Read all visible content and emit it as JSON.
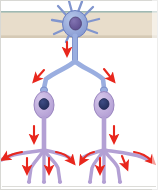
{
  "figure": {
    "background_color": "#ffffff",
    "frame_border_color": "#d8d8d4",
    "width": 158,
    "height": 190
  },
  "tissue_band": {
    "name": "spinal cord / CNS tissue band",
    "fill_color": "#e8ddcb",
    "top_edge_color": "#9fb9b4",
    "shadow_color": "#c6bba9",
    "top": 11,
    "height": 27
  },
  "neurons": [
    {
      "id": "preganglionic-neuron",
      "label": "preganglionic neuron",
      "soma_shape": "stellate",
      "soma_fill": "#93a9dc",
      "soma_stroke": "#6b7fc0",
      "nucleus_fill": "#6a5a9c",
      "nucleus_stroke": "#514277",
      "dendrite_count": 9,
      "cx": 75,
      "cy": 24,
      "soma_rx": 12,
      "soma_ry": 13
    },
    {
      "id": "postganglionic-neuron-left",
      "label": "postganglionic ganglion neuron (left)",
      "soma_shape": "spindle",
      "soma_fill": "#c3b0de",
      "soma_stroke": "#9a86c0",
      "nucleus_fill": "#2d3a6e",
      "nucleus_stroke": "#222c55",
      "cx": 44,
      "cy": 105,
      "soma_rx": 10,
      "soma_ry": 13
    },
    {
      "id": "postganglionic-neuron-right",
      "label": "postganglionic ganglion neuron (right)",
      "soma_shape": "spindle",
      "soma_fill": "#c3b0de",
      "soma_stroke": "#9a86c0",
      "nucleus_fill": "#2d3a6e",
      "nucleus_stroke": "#222c55",
      "cx": 104,
      "cy": 105,
      "soma_rx": 10,
      "soma_ry": 13
    }
  ],
  "axons": {
    "preganglionic_color": "#9aaee0",
    "preganglionic_stroke": "#7287c4",
    "postganglionic_color": "#b3a0d4",
    "postganglionic_stroke": "#8d79b6",
    "main_axon_width": 5,
    "branch_width": 4,
    "terminal_width": 3.5
  },
  "arrows": {
    "color": "#e8271d",
    "dark_color": "#c41a12",
    "semantic": "direction of nerve impulse conduction",
    "count": 13,
    "items": [
      {
        "id": "arrow-axon-main",
        "direction": "down",
        "x": 68,
        "y": 48
      },
      {
        "id": "arrow-branch-left",
        "direction": "down-left",
        "x": 38,
        "y": 77
      },
      {
        "id": "arrow-branch-right",
        "direction": "down-right",
        "x": 110,
        "y": 77
      },
      {
        "id": "arrow-postgang-left",
        "direction": "down",
        "x": 36,
        "y": 133
      },
      {
        "id": "arrow-postgang-right",
        "direction": "down",
        "x": 112,
        "y": 133
      },
      {
        "id": "arrow-terminal-l-curve",
        "direction": "curve-left",
        "x": 10,
        "y": 155
      },
      {
        "id": "arrow-terminal-l-down",
        "direction": "down",
        "x": 27,
        "y": 165
      },
      {
        "id": "arrow-terminal-l-mid",
        "direction": "down",
        "x": 49,
        "y": 165
      },
      {
        "id": "arrow-terminal-l-curveR",
        "direction": "curve-right",
        "x": 64,
        "y": 157
      },
      {
        "id": "arrow-terminal-r-curveL",
        "direction": "curve-left",
        "x": 88,
        "y": 157
      },
      {
        "id": "arrow-terminal-r-down",
        "direction": "down",
        "x": 104,
        "y": 165
      },
      {
        "id": "arrow-terminal-r-mid",
        "direction": "down",
        "x": 126,
        "y": 160
      },
      {
        "id": "arrow-terminal-r-curveR",
        "direction": "curve-right",
        "x": 146,
        "y": 157
      }
    ]
  },
  "terminal_branches": {
    "left_effector_branch_count": 4,
    "right_effector_branch_count": 4,
    "tip_color": "#b3a0d4",
    "tip_y": 182
  },
  "synapses": [
    {
      "id": "synapse-left",
      "x": 44,
      "y": 90,
      "bouton_fill": "#9aaee0"
    },
    {
      "id": "synapse-right",
      "x": 104,
      "y": 90,
      "bouton_fill": "#9aaee0"
    }
  ]
}
